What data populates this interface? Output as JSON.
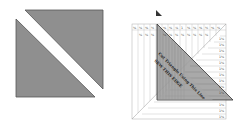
{
  "figure": {
    "left_panel": {
      "description": "Square split into two gray triangles by a white diagonal strip",
      "fill_color": "#8f8f8f",
      "stroke_color": "#555555"
    },
    "right_panel": {
      "description": "Triangle ruler overlaid on a square grid ruler with diagonal lines",
      "small_triangle_marker": true,
      "top_row_labels": [
        "⅛",
        "¼",
        "⅜",
        "½",
        "⅝",
        "¾",
        "⅞",
        "1",
        "⅛",
        "¼",
        "⅜",
        "½",
        "⅝",
        "¾"
      ],
      "second_row_labels": [
        "¼",
        "¼",
        "¼",
        "¼",
        "¼",
        "¼",
        "¼",
        "¼",
        "¼",
        "¼",
        "¼"
      ],
      "right_col_labels": [
        "1¼",
        "1¼",
        "1¼",
        "1¼",
        "1¼",
        "1¼",
        "1¼",
        "1¼",
        "1¼",
        "1¼",
        "1¼",
        "1¼",
        "1¼",
        "1¼"
      ],
      "ruler_text_1": "Cut Triangle Using This Line",
      "ruler_text_2": "SEW THIS EDGE",
      "triangle_fill": "#9a9a9a",
      "grid_color": "#9a9a9a"
    }
  }
}
